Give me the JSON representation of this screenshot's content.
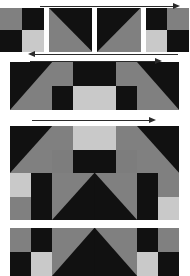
{
  "figure": {
    "background": "#ffffff",
    "width": 189,
    "height": 245
  },
  "palette": {
    "black": "#111111",
    "dark": "#161616",
    "mid_gray": "#808080",
    "gray": "#7d7d7d",
    "light_gray": "#c9c9c9",
    "pale_gray": "#b4b4b4",
    "outline": "#2a2a2a",
    "page": "#ffffff"
  },
  "arrows": [
    {
      "name": "arrow-top",
      "direction": "right",
      "label": "",
      "x": 40,
      "y": 2,
      "width": 140
    },
    {
      "name": "arrow-row1-bottom",
      "direction": "left",
      "label": "",
      "x": 28,
      "y": 50,
      "width": 150
    },
    {
      "name": "arrow-row2-top",
      "direction": "right",
      "label": "",
      "x": 30,
      "y": 57,
      "width": 132
    },
    {
      "name": "arrow-row3-top",
      "direction": "right",
      "label": "",
      "x": 32,
      "y": 116,
      "width": 124
    }
  ],
  "blocks": [
    {
      "name": "block-tile-row",
      "kind": "tile-strip",
      "x": 0,
      "y": 8,
      "width": 189,
      "height": 44,
      "gap": 5,
      "tiles": [
        {
          "name": "tile-checker-a",
          "type": "quad",
          "colors": [
            "#808080",
            "#111111",
            "#111111",
            "#c9c9c9"
          ]
        },
        {
          "name": "tile-diagonal-a",
          "type": "diag",
          "orientation": "tl-br",
          "colors": [
            "#111111",
            "#808080"
          ]
        },
        {
          "name": "tile-diagonal-b",
          "type": "diag",
          "orientation": "tr-bl",
          "colors": [
            "#111111",
            "#808080"
          ]
        },
        {
          "name": "tile-checker-b",
          "type": "quad",
          "colors": [
            "#111111",
            "#808080",
            "#c9c9c9",
            "#111111"
          ]
        }
      ]
    },
    {
      "name": "block-strip-4x1",
      "kind": "mosaic",
      "x": 10,
      "y": 62,
      "width": 169,
      "height": 48,
      "cols": 4,
      "rows": 1,
      "cells": [
        {
          "name": "mosaic-cell",
          "type": "diag",
          "orientation": "tr-bl",
          "colors": [
            "#111111",
            "#808080"
          ]
        },
        {
          "name": "mosaic-cell",
          "type": "quad",
          "colors": [
            "#808080",
            "#111111",
            "#111111",
            "#c9c9c9"
          ]
        },
        {
          "name": "mosaic-cell",
          "type": "quad",
          "colors": [
            "#111111",
            "#808080",
            "#c9c9c9",
            "#111111"
          ]
        },
        {
          "name": "mosaic-cell",
          "type": "diag",
          "orientation": "tl-br",
          "colors": [
            "#111111",
            "#808080"
          ]
        }
      ]
    },
    {
      "name": "block-mosaic-4x2",
      "kind": "mosaic",
      "x": 10,
      "y": 126,
      "width": 169,
      "height": 94,
      "cols": 4,
      "rows": 2,
      "cells": [
        {
          "name": "mosaic-cell",
          "type": "diag",
          "orientation": "tr-bl",
          "colors": [
            "#111111",
            "#808080"
          ]
        },
        {
          "name": "mosaic-cell",
          "type": "quad",
          "colors": [
            "#808080",
            "#c9c9c9",
            "#7d7d7d",
            "#111111"
          ]
        },
        {
          "name": "mosaic-cell",
          "type": "quad",
          "colors": [
            "#c9c9c9",
            "#808080",
            "#111111",
            "#7d7d7d"
          ]
        },
        {
          "name": "mosaic-cell",
          "type": "diag",
          "orientation": "tl-br",
          "colors": [
            "#111111",
            "#808080"
          ]
        },
        {
          "name": "mosaic-cell",
          "type": "quad",
          "colors": [
            "#c9c9c9",
            "#111111",
            "#808080",
            "#111111"
          ]
        },
        {
          "name": "mosaic-cell",
          "type": "diag",
          "orientation": "tl-br-up",
          "colors": [
            "#111111",
            "#808080"
          ]
        },
        {
          "name": "mosaic-cell",
          "type": "diag",
          "orientation": "tr-bl-up",
          "colors": [
            "#111111",
            "#808080"
          ]
        },
        {
          "name": "mosaic-cell",
          "type": "quad",
          "colors": [
            "#111111",
            "#808080",
            "#111111",
            "#c9c9c9"
          ]
        }
      ]
    },
    {
      "name": "block-mosaic-cropped",
      "kind": "mosaic",
      "x": 10,
      "y": 228,
      "width": 169,
      "height": 48,
      "cols": 4,
      "rows": 1,
      "cropped": true,
      "cells": [
        {
          "name": "mosaic-cell",
          "type": "quad",
          "colors": [
            "#808080",
            "#111111",
            "#111111",
            "#c9c9c9"
          ]
        },
        {
          "name": "mosaic-cell",
          "type": "diag",
          "orientation": "tl-br-up",
          "colors": [
            "#111111",
            "#808080"
          ]
        },
        {
          "name": "mosaic-cell",
          "type": "diag",
          "orientation": "tr-bl-up",
          "colors": [
            "#111111",
            "#808080"
          ]
        },
        {
          "name": "mosaic-cell",
          "type": "quad",
          "colors": [
            "#111111",
            "#808080",
            "#c9c9c9",
            "#111111"
          ]
        }
      ]
    }
  ]
}
